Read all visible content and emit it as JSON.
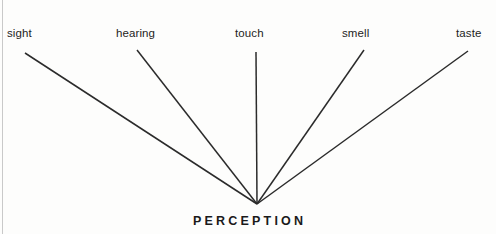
{
  "diagram": {
    "type": "convergence-fan",
    "background_color": "#fefefe",
    "line_color": "#2b2b2b",
    "text_color": "#1d1d1d",
    "center": {
      "label": "PERCEPTION",
      "apex_x": 257,
      "apex_y": 204
    },
    "senses": [
      {
        "id": "sight",
        "label": "sight",
        "line_start_x": 25,
        "line_start_y": 53,
        "line_end_x": 257,
        "line_end_y": 204
      },
      {
        "id": "hearing",
        "label": "hearing",
        "line_start_x": 137,
        "line_start_y": 50,
        "line_end_x": 257,
        "line_end_y": 204
      },
      {
        "id": "touch",
        "label": "touch",
        "line_start_x": 256,
        "line_start_y": 52,
        "line_end_x": 257,
        "line_end_y": 204
      },
      {
        "id": "smell",
        "label": "smell",
        "line_start_x": 364,
        "line_start_y": 50,
        "line_end_x": 257,
        "line_end_y": 204
      },
      {
        "id": "taste",
        "label": "taste",
        "line_start_x": 468,
        "line_start_y": 51,
        "line_end_x": 257,
        "line_end_y": 204
      }
    ]
  }
}
